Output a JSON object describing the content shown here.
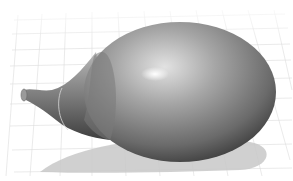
{
  "scene": {
    "description": "3D render of a smooth gray egg-shaped body with a curved spout on a perspective ground grid",
    "colors": {
      "background": "#ffffff",
      "grid_line": "#dcdcdc",
      "body_light": "#d2d2d2",
      "body_mid": "#8e8e8e",
      "body_dark": "#3a3a3a",
      "highlight": "#ffffff",
      "shadow": "#c8c8c8"
    },
    "objects": [
      {
        "name": "ground-grid",
        "type": "perspective-grid"
      },
      {
        "name": "egg-body",
        "type": "ellipsoid"
      },
      {
        "name": "spout",
        "type": "curved-neck"
      },
      {
        "name": "cast-shadow",
        "type": "shadow"
      }
    ]
  }
}
